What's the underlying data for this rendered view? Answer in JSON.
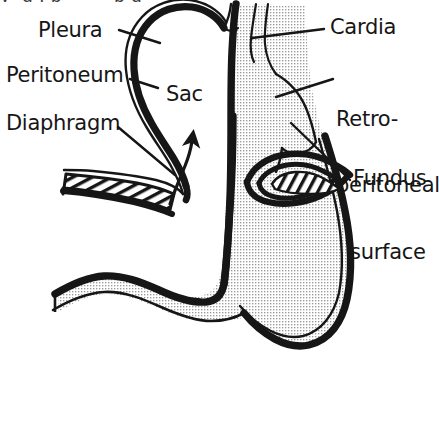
{
  "figure": {
    "caption_remnant": "y  g , p         p g",
    "background_color": "#ffffff",
    "ink_color": "#161616",
    "stipple_color": "#8d8d8d",
    "width": 439,
    "height": 425
  },
  "labels": {
    "pleura": {
      "text": "Pleura",
      "x": 38,
      "y": 19
    },
    "peritoneum": {
      "text": "Peritoneum",
      "x": 8,
      "y": 64
    },
    "diaphragm": {
      "text": "Diaphragm",
      "x": 8,
      "y": 112
    },
    "sac": {
      "text": "Sac",
      "x": 165,
      "y": 83
    },
    "cardia": {
      "text": "Cardia",
      "x": 330,
      "y": 17
    },
    "retroperitoneal_surface": {
      "line1": "Retro-",
      "line2": "peritoneal",
      "line3": "surface",
      "x": 336,
      "y": 64
    },
    "fundus": {
      "text": "Fundus",
      "x": 353,
      "y": 168
    }
  },
  "structures": [
    {
      "name": "hernia-sac",
      "label": "Sac",
      "description": "Peritoneal sac herniated above the diaphragm"
    },
    {
      "name": "pleura-layer",
      "label": "Pleura",
      "description": "Thin outer line covering the hernia sac"
    },
    {
      "name": "peritoneum-layer",
      "label": "Peritoneum",
      "description": "Thick dark line lining the hernia sac"
    },
    {
      "name": "diaphragm-left-crus",
      "label": "Diaphragm",
      "description": "Hatched muscular band left of the hiatus"
    },
    {
      "name": "diaphragm-right-crus",
      "label": "Diaphragm",
      "description": "Hatched muscular band right of the hiatus"
    },
    {
      "name": "cardia",
      "label": "Cardia",
      "description": "Gastro-oesophageal junction at top of stomach"
    },
    {
      "name": "fundus",
      "label": "Fundus",
      "description": "Upper rounded portion of the stomach"
    },
    {
      "name": "retroperitoneal-surface",
      "label": "Retro-peritoneal surface",
      "description": "Bare posterior surface of stomach without peritoneum"
    },
    {
      "name": "stomach-body",
      "label": "Stomach",
      "description": "Stippled J-shaped gastric lumen"
    },
    {
      "name": "herniation-arrow",
      "label": "",
      "description": "Upward curved arrow indicating direction of herniation"
    }
  ],
  "leader_lines": [
    {
      "from": "pleura",
      "to": "hernia-sac-outer-line"
    },
    {
      "from": "peritoneum",
      "to": "hernia-sac-inner-line"
    },
    {
      "from": "diaphragm",
      "to": "diaphragm-left-crus"
    },
    {
      "from": "cardia",
      "to": "cardia"
    },
    {
      "from": "retroperitoneal_surface",
      "to": "retroperitoneal-surface"
    },
    {
      "from": "fundus",
      "to": "fundus"
    }
  ]
}
